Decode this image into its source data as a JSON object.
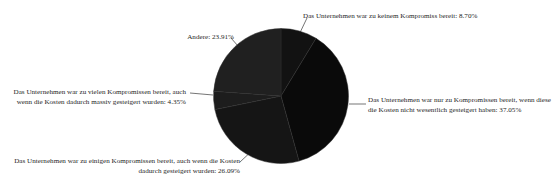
{
  "chart_data": {
    "type": "pie",
    "title": "",
    "subtitle": "",
    "xlabel": "",
    "ylabel": "",
    "legend_position": "none",
    "labels_position": "outside-with-leader-lines",
    "grid": false,
    "start_angle_deg": 0,
    "direction": "clockwise",
    "categories": [
      "Das Unternehmen war zu keinem Kompromiss bereit",
      "Das Unternehmen war nur zu Kompromissen bereit, wenn diese die Kosten nicht wesentlich gesteigert haben",
      "Das Unternehmen war zu einigen Kompromissen bereit, auch wenn die Kosten dadurch gesteigert wurden",
      "Das Unternehmen war zu vielen Kompromissen bereit, auch wenn die Kosten dadurch massiv gesteigert wurden",
      "Andere"
    ],
    "values": [
      8.7,
      37.05,
      26.09,
      4.35,
      23.91
    ],
    "value_unit": "%",
    "slices": [
      {
        "name": "keinem-kompromiss",
        "label": "Das Unternehmen war zu keinem Kompromiss bereit: 8.70%",
        "value": 8.7,
        "color": "#121212"
      },
      {
        "name": "nur-kompromissen",
        "label": "Das Unternehmen war nur zu Kompromissen bereit, wenn diese die Kosten nicht wesentlich gesteigert haben: 37.05%",
        "value": 37.05,
        "color": "#0a0a0a"
      },
      {
        "name": "einigen-kompromissen",
        "label": "Das Unternehmen war zu einigen Kompromissen bereit, auch wenn die Kosten dadurch gesteigert wurden: 26.09%",
        "value": 26.09,
        "color": "#151515"
      },
      {
        "name": "vielen-kompromissen",
        "label": "Das Unternehmen war zu vielen Kompromissen bereit, auch wenn die Kosten dadurch massiv gesteigert wurden: 4.35%",
        "value": 4.35,
        "color": "#1d1d1d"
      },
      {
        "name": "andere",
        "label": "Andere: 23.91%",
        "value": 23.91,
        "color": "#202020"
      }
    ]
  },
  "labels": {
    "keinem": "Das Unternehmen war zu keinem Kompromiss bereit: 8.70%",
    "andere": "Andere: 23.91%",
    "nur": "Das Unternehmen war nur zu Kompromissen bereit, wenn diese die Kosten nicht wesentlich gesteigert haben: 37.05%",
    "vielen": "Das Unternehmen war zu vielen Kompromissen bereit, auch wenn die Kosten dadurch massiv gesteigert wurden: 4.35%",
    "einigen": "Das Unternehmen war zu einigen Kompromissen bereit, auch wenn die Kosten dadurch gesteigert wurden: 26.09%"
  },
  "colors": {
    "background": "#ffffff",
    "text": "#262626",
    "leader_line": "#3a3a3a",
    "pie_base": "#101010"
  }
}
